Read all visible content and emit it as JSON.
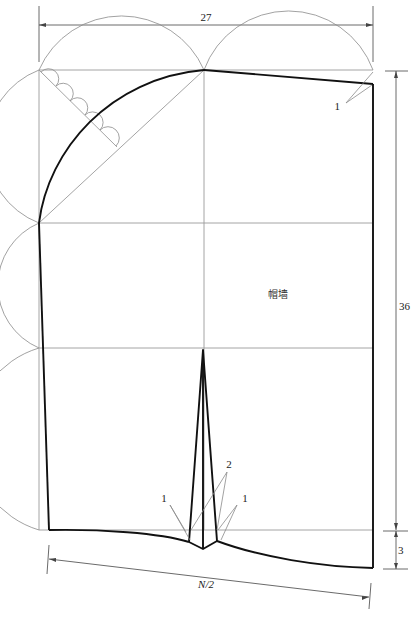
{
  "diagram": {
    "part_label": "帽墙",
    "dimensions": {
      "width_top": "27",
      "height_right": "36",
      "hem_drop": "3",
      "bottom_span": "N/2"
    },
    "dart_annotations": {
      "left": "1",
      "center": "2",
      "right": "1"
    },
    "corner_annotation": "1",
    "colors": {
      "outline": "#111111",
      "construction": "#8a8a8a",
      "background": "#ffffff"
    }
  }
}
